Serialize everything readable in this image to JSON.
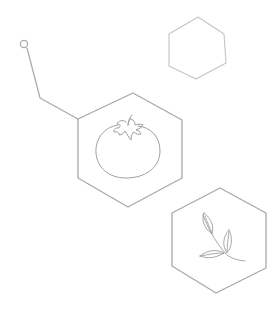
{
  "diagram": {
    "background": "#ffffff",
    "stroke_color": "#a8a8a8",
    "light_stroke_color": "#c4c4c4",
    "nodes": [
      {
        "id": "empty-hexagon",
        "icon": "none"
      },
      {
        "id": "tomato-hexagon",
        "icon": "tomato-icon"
      },
      {
        "id": "leaf-hexagon",
        "icon": "leaf-sprig-icon"
      }
    ],
    "connector": {
      "start": "circle-node",
      "end": "tomato-hexagon"
    }
  }
}
